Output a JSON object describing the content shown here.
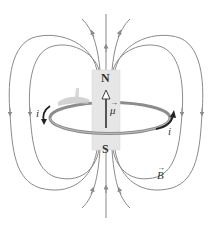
{
  "diagram": {
    "labels": {
      "north": "N",
      "south": "S",
      "moment": "μ",
      "field": "B",
      "current_left": "i",
      "current_right": "i",
      "vector_arrow": "→"
    },
    "colors": {
      "field_line": "#8a8a8a",
      "magnet_fill": "#e6e6e6",
      "magnet_edge": "#d0d0d0",
      "loop": "#8c8c8c",
      "loop_inner": "#bdbdbd",
      "current_arrow": "#222222",
      "text": "#333333"
    },
    "components": [
      {
        "id": "bar-magnet",
        "poles": [
          "N",
          "S"
        ]
      },
      {
        "id": "current-loop",
        "current_direction": "counterclockwise viewed from above"
      },
      {
        "id": "magnetic-moment-arrow",
        "direction": "up"
      },
      {
        "id": "field-lines",
        "direction": "out of N, into S"
      }
    ]
  }
}
